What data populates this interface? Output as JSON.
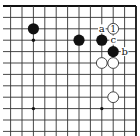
{
  "diagram": {
    "type": "go-board-fragment",
    "corner": "top-right",
    "grid": {
      "columns": 12,
      "rows": 12,
      "spacing_px": 11.4,
      "origin_x": 10.6,
      "origin_y": 6,
      "top_edge": true,
      "right_edge": true,
      "line_color": "#333333",
      "edge_color": "#111111"
    },
    "star_points": [
      {
        "col": 2,
        "row": 3
      },
      {
        "col": 2,
        "row": 9
      },
      {
        "col": 8,
        "row": 9
      }
    ],
    "stones": [
      {
        "color": "black",
        "col": 2,
        "row": 2,
        "label": ""
      },
      {
        "color": "black",
        "col": 6,
        "row": 3,
        "label": ""
      },
      {
        "color": "black",
        "col": 8,
        "row": 3,
        "label": ""
      },
      {
        "color": "black",
        "col": 9,
        "row": 4,
        "label": ""
      },
      {
        "color": "white",
        "col": 9,
        "row": 2,
        "label": "1"
      },
      {
        "color": "white",
        "col": 8,
        "row": 5,
        "label": ""
      },
      {
        "color": "white",
        "col": 9,
        "row": 5,
        "label": ""
      },
      {
        "color": "white",
        "col": 9,
        "row": 8,
        "label": ""
      }
    ],
    "letter_marks": [
      {
        "text": "a",
        "col": 8,
        "row": 2
      },
      {
        "text": "c",
        "col": 9,
        "row": 3
      },
      {
        "text": "b",
        "col": 10,
        "row": 4
      }
    ],
    "colors": {
      "black_stone": "#111111",
      "white_stone_fill": "#ffffff",
      "white_stone_stroke": "#333333",
      "background": "#ffffff"
    }
  }
}
